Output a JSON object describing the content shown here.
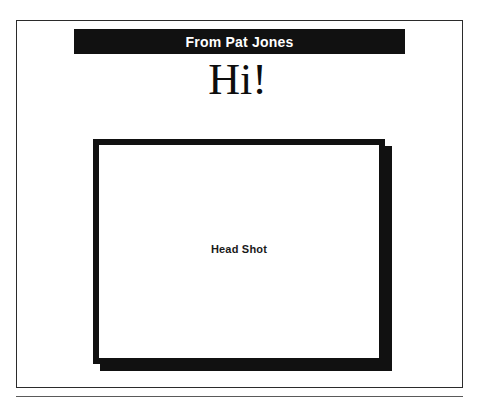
{
  "slide": {
    "title_banner": {
      "text": "From Pat Jones",
      "background_color": "#111111",
      "text_color": "#ffffff"
    },
    "subtitle": {
      "text": "Hi!",
      "color": "#0d0d0d"
    },
    "placeholder": {
      "label": "Head Shot",
      "border_color": "#111111",
      "shadow_color": "#111111",
      "fill_color": "#ffffff"
    },
    "frame": {
      "border_color": "#2b2b2b",
      "background_color": "#ffffff"
    },
    "bottom_rule": {
      "color": "#5a5a5a"
    },
    "page_background": "#ffffff"
  }
}
